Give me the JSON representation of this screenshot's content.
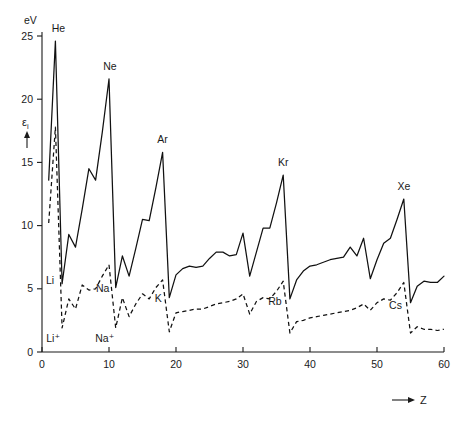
{
  "figure": {
    "y_unit_label": "eV",
    "y_axis_symbol": "ε",
    "y_axis_subscript": "i",
    "x_axis_label": "Z",
    "x_axis_arrow": "→",
    "y_arrow": "↑"
  },
  "chart_data": {
    "type": "line",
    "title": "",
    "xlabel": "Z",
    "ylabel": "ε_i",
    "yunit": "eV",
    "xlim": [
      0,
      60
    ],
    "ylim": [
      0,
      25
    ],
    "xticks": [
      0,
      10,
      20,
      30,
      40,
      50,
      60
    ],
    "yticks": [
      0,
      5,
      10,
      15,
      20,
      25
    ],
    "grid": false,
    "legend": "none",
    "series": [
      {
        "name": "neutral-atom-ionization-energy",
        "style": "solid",
        "x": [
          1,
          2,
          3,
          4,
          5,
          6,
          7,
          8,
          9,
          10,
          11,
          12,
          13,
          14,
          15,
          16,
          17,
          18,
          19,
          20,
          21,
          22,
          23,
          24,
          25,
          26,
          27,
          28,
          29,
          30,
          31,
          32,
          33,
          34,
          35,
          36,
          37,
          38,
          39,
          40,
          41,
          42,
          43,
          44,
          45,
          46,
          47,
          48,
          49,
          50,
          51,
          52,
          53,
          54,
          55,
          56,
          57,
          58,
          59,
          60
        ],
        "values": [
          13.6,
          24.6,
          5.4,
          9.3,
          8.3,
          11.3,
          14.5,
          13.6,
          17.4,
          21.6,
          5.1,
          7.6,
          6.0,
          8.2,
          10.5,
          10.4,
          13.0,
          15.8,
          4.3,
          6.1,
          6.6,
          6.8,
          6.7,
          6.8,
          7.4,
          7.9,
          7.9,
          7.6,
          7.7,
          9.4,
          6.0,
          7.9,
          9.8,
          9.8,
          11.8,
          14.0,
          4.2,
          5.7,
          6.4,
          6.8,
          6.9,
          7.1,
          7.3,
          7.4,
          7.5,
          8.3,
          7.6,
          9.0,
          5.8,
          7.3,
          8.6,
          9.0,
          10.5,
          12.1,
          3.9,
          5.2,
          5.6,
          5.5,
          5.5,
          6.0
        ]
      },
      {
        "name": "singly-ionized-ion-ionization-energy",
        "style": "dashed",
        "x": [
          1,
          2,
          3,
          4,
          5,
          6,
          7,
          8,
          9,
          10,
          11,
          12,
          13,
          14,
          15,
          16,
          17,
          18,
          19,
          20,
          21,
          22,
          23,
          24,
          25,
          26,
          27,
          28,
          29,
          30,
          31,
          32,
          33,
          34,
          35,
          36,
          37,
          38,
          39,
          40,
          41,
          42,
          43,
          44,
          45,
          46,
          47,
          48,
          49,
          50,
          51,
          52,
          53,
          54,
          55,
          56,
          57,
          58,
          59,
          60
        ],
        "values": [
          10.2,
          17.8,
          1.9,
          4.2,
          3.4,
          5.3,
          4.9,
          5.0,
          6.0,
          6.9,
          1.9,
          4.3,
          2.8,
          3.8,
          4.6,
          4.2,
          5.1,
          5.7,
          1.6,
          3.1,
          3.2,
          3.3,
          3.4,
          3.4,
          3.6,
          3.8,
          3.9,
          4.0,
          4.2,
          4.6,
          3.0,
          4.0,
          4.3,
          4.2,
          4.8,
          5.6,
          1.5,
          2.4,
          2.5,
          2.7,
          2.8,
          2.9,
          3.0,
          3.1,
          3.2,
          3.3,
          3.5,
          3.8,
          3.3,
          3.9,
          4.2,
          4.1,
          4.7,
          5.5,
          1.5,
          2.0,
          1.8,
          1.8,
          1.7,
          1.8
        ]
      }
    ],
    "annotations": [
      {
        "text": "He",
        "z": 2,
        "value": 24.6,
        "series": "solid",
        "dx": 3,
        "dy": -9
      },
      {
        "text": "Ne",
        "z": 10,
        "value": 21.6,
        "series": "solid",
        "dx": 1,
        "dy": -9
      },
      {
        "text": "Ar",
        "z": 18,
        "value": 15.8,
        "series": "solid",
        "dx": 0,
        "dy": -9
      },
      {
        "text": "Kr",
        "z": 36,
        "value": 14.0,
        "series": "solid",
        "dx": 0,
        "dy": -9
      },
      {
        "text": "Xe",
        "z": 54,
        "value": 12.1,
        "series": "solid",
        "dx": 0,
        "dy": -9
      },
      {
        "text": "Li",
        "z": 3,
        "value": 5.4,
        "series": "solid",
        "dx": -12,
        "dy": 0
      },
      {
        "text": "Na",
        "z": 11,
        "value": 5.1,
        "series": "solid",
        "dx": -13,
        "dy": 4
      },
      {
        "text": "K",
        "z": 19,
        "value": 4.3,
        "series": "solid",
        "dx": -11,
        "dy": 4
      },
      {
        "text": "Rb",
        "z": 37,
        "value": 4.2,
        "series": "solid",
        "dx": -15,
        "dy": 6
      },
      {
        "text": "Cs",
        "z": 55,
        "value": 3.9,
        "series": "solid",
        "dx": -15,
        "dy": 6
      },
      {
        "text": "Li⁺",
        "z": 3,
        "value": 1.9,
        "series": "dashed",
        "dx": -9,
        "dy": 14
      },
      {
        "text": "Na⁺",
        "z": 11,
        "value": 1.9,
        "series": "dashed",
        "dx": -11,
        "dy": 14
      }
    ]
  }
}
